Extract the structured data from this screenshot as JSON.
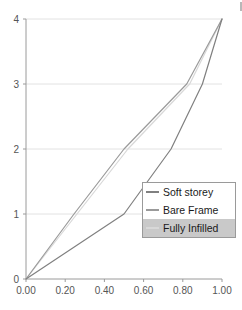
{
  "chart_data": {
    "type": "line",
    "title": "",
    "xlabel": "",
    "ylabel": "",
    "xlim": [
      0.0,
      1.0
    ],
    "ylim": [
      0,
      4
    ],
    "xticks": [
      "0.00",
      "0.20",
      "0.40",
      "0.60",
      "0.80",
      "1.00"
    ],
    "xtick_values": [
      0.0,
      0.2,
      0.4,
      0.6,
      0.8,
      1.0
    ],
    "yticks": [
      "0",
      "1",
      "2",
      "3",
      "4"
    ],
    "ytick_values": [
      0,
      1,
      2,
      3,
      4
    ],
    "grid": true,
    "grid_axis": "y",
    "legend_position": "lower-right",
    "series": [
      {
        "name": "Soft storey",
        "color": "#808080",
        "x": [
          0.0,
          0.5,
          0.74,
          0.9,
          1.0
        ],
        "y": [
          0,
          1,
          2,
          3,
          4
        ]
      },
      {
        "name": "Bare Frame",
        "color": "#9a9a9a",
        "x": [
          0.0,
          0.245,
          0.5,
          0.82,
          1.0
        ],
        "y": [
          0,
          1,
          2,
          3,
          4
        ]
      },
      {
        "name": "Fully Infilled",
        "color": "#d8d8d8",
        "x": [
          0.0,
          0.26,
          0.52,
          0.835,
          1.0
        ],
        "y": [
          0,
          1,
          2,
          3,
          4
        ]
      }
    ]
  },
  "legend": {
    "entries": [
      {
        "label": "Soft storey",
        "color": "#808080",
        "shaded": false
      },
      {
        "label": "Bare Frame",
        "color": "#9a9a9a",
        "shaded": false
      },
      {
        "label": "Fully Infilled",
        "color": "#d8d8d8",
        "shaded": true
      }
    ]
  },
  "colors": {
    "axis": "#9a9a9a",
    "grid": "#e2e2e2",
    "tick_text": "#555555",
    "legend_border": "#9a9a9a",
    "legend_shade": "#c9c9c9",
    "background": "#ffffff"
  }
}
